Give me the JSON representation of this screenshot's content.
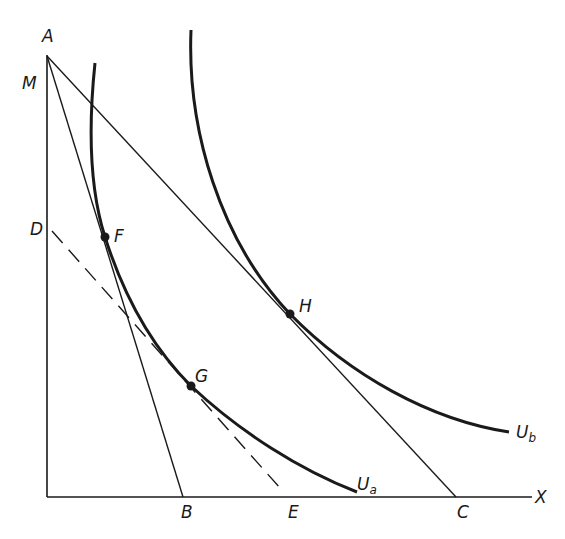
{
  "diagram": {
    "type": "indifference-curve-budget-lines",
    "axes": {
      "x_label": "X"
    },
    "points": {
      "A": "A",
      "M": "M",
      "D": "D",
      "F": "F",
      "G": "G",
      "H": "H",
      "B": "B",
      "E": "E",
      "C": "C"
    },
    "curves": {
      "ua": {
        "main": "U",
        "sub": "a"
      },
      "ub": {
        "main": "U",
        "sub": "b"
      }
    },
    "lines": [
      {
        "name": "budget-line-AB",
        "from": "A",
        "to": "B",
        "style": "solid"
      },
      {
        "name": "budget-line-AC",
        "from": "A",
        "to": "C",
        "style": "solid"
      },
      {
        "name": "compensated-line-DE",
        "from": "D",
        "to": "E",
        "style": "dashed"
      }
    ],
    "color": "#1a1a1a"
  }
}
